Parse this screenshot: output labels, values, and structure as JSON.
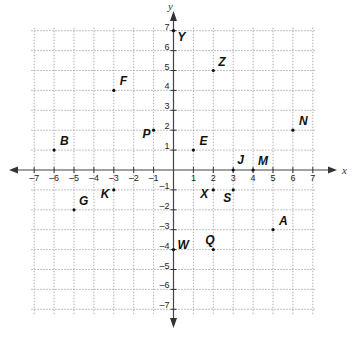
{
  "chart_data": {
    "type": "scatter",
    "title": "",
    "xlabel": "x",
    "ylabel": "y",
    "xlim": [
      -7,
      7
    ],
    "ylim": [
      -7,
      7
    ],
    "grid": true,
    "x_ticks": [
      -7,
      -6,
      -5,
      -4,
      -3,
      -2,
      -1,
      1,
      2,
      3,
      4,
      5,
      6,
      7
    ],
    "y_ticks": [
      -7,
      -6,
      -5,
      -4,
      -3,
      -2,
      -1,
      1,
      2,
      3,
      4,
      5,
      6,
      7
    ],
    "points": [
      {
        "label": "A",
        "x": 5,
        "y": -3,
        "dx": 6,
        "dy": -5
      },
      {
        "label": "B",
        "x": -6,
        "y": 1,
        "dx": 6,
        "dy": -5
      },
      {
        "label": "E",
        "x": 1,
        "y": 1,
        "dx": 6,
        "dy": -5
      },
      {
        "label": "F",
        "x": -3,
        "y": 4,
        "dx": 6,
        "dy": -5
      },
      {
        "label": "G",
        "x": -5,
        "y": -2,
        "dx": 5,
        "dy": -5
      },
      {
        "label": "J",
        "x": 3,
        "y": 0,
        "dx": 4,
        "dy": -6
      },
      {
        "label": "K",
        "x": -3,
        "y": -1,
        "dx": -13,
        "dy": 8
      },
      {
        "label": "M",
        "x": 4,
        "y": 0,
        "dx": 5,
        "dy": -5
      },
      {
        "label": "N",
        "x": 6,
        "y": 2,
        "dx": 6,
        "dy": -5
      },
      {
        "label": "P",
        "x": -1,
        "y": 2,
        "dx": -11,
        "dy": 8
      },
      {
        "label": "Q",
        "x": 2,
        "y": -4,
        "dx": -8,
        "dy": -6
      },
      {
        "label": "S",
        "x": 3,
        "y": -1,
        "dx": -10,
        "dy": 12
      },
      {
        "label": "W",
        "x": 0,
        "y": -4,
        "dx": 4,
        "dy": -1
      },
      {
        "label": "X",
        "x": 2,
        "y": -1,
        "dx": -13,
        "dy": 8
      },
      {
        "label": "Y",
        "x": 0,
        "y": 7,
        "dx": 4,
        "dy": 10
      },
      {
        "label": "Z",
        "x": 2,
        "y": 5,
        "dx": 5,
        "dy": -5
      }
    ]
  }
}
